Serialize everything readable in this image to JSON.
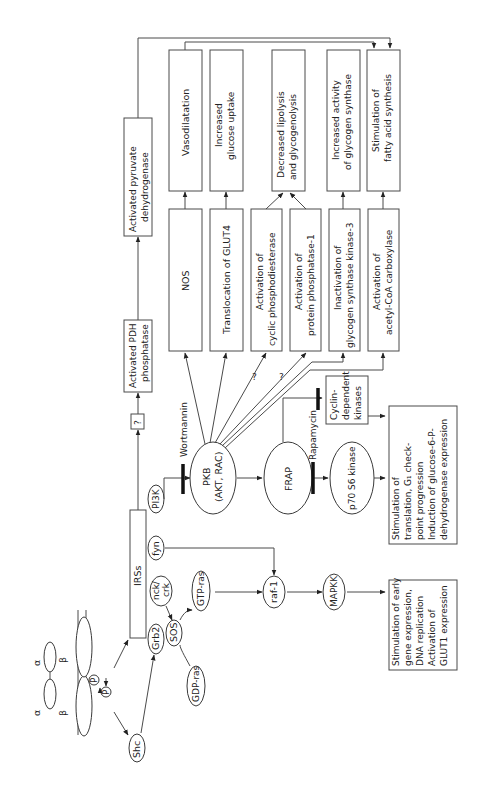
{
  "diagram": {
    "orientation": "rotated -90deg (text reads bottom to top)",
    "receptor": {
      "alpha_left": "α",
      "alpha_right": "α",
      "beta_left": "β",
      "beta_right": "β",
      "phospho_1": "P",
      "phospho_2": "P"
    },
    "nodes": {
      "shc": "Shc",
      "irss": "IRSs",
      "grb2": "Grb2",
      "nck_crk_1": "nck/",
      "nck_crk_2": "crk",
      "fyn": "fyn",
      "pi3k": "PI3K",
      "sos": "SOS",
      "gdp_ras": "GDP-ras",
      "gtp_ras": "GTP-ras",
      "raf1": "raf-1",
      "mapkk": "MAPKK",
      "pkb_1": "PKB",
      "pkb_2": "(AKT, RAC)",
      "frap": "FRAP",
      "p70": "p70 S6 kinase",
      "unknown": "?",
      "wortmannin": "Wortmannin",
      "rapamycin": "Rapamycin",
      "question_1": "?",
      "question_2": "?"
    },
    "boxes": {
      "pdh_phosphatase": [
        "Activated PDH",
        "phosphatase"
      ],
      "pdh": [
        "Activated pyruvate",
        "dehydrogenase"
      ],
      "nos": [
        "NOS"
      ],
      "vasodilatation": [
        "Vasodilatation"
      ],
      "glut4": [
        "Translocation of GLUT4"
      ],
      "glucose_uptake": [
        "Increased",
        "glucose uptake"
      ],
      "cyclic_pde": [
        "Activation of",
        "cyclic phosphodiesterase"
      ],
      "pp1": [
        "Activation of",
        "protein phosphatase-1"
      ],
      "lipolysis": [
        "Decreased lipolysis",
        "and glycogenolysis"
      ],
      "gsk3": [
        "Inactivation of",
        "glycogen synthase kinase-3"
      ],
      "glycogen_synthase": [
        "Increased activity",
        "of glycogen synthase"
      ],
      "acc": [
        "Activation of",
        "acetyl-CoA carboxylase"
      ],
      "fatty_acid": [
        "Stimulation of",
        "fatty acid synthesis"
      ],
      "cdk": [
        "Cyclin-",
        "dependent",
        "kinases"
      ],
      "translation": [
        "Stimulation of",
        "translation, G₁ check-",
        "point progression",
        "Induction of glucose-6-P-",
        "dehydrogenase expression"
      ],
      "early_gene": [
        "Stimulation of early",
        "gene expression,",
        "DNA replication",
        "Activation of",
        "GLUT1 expression"
      ]
    }
  }
}
